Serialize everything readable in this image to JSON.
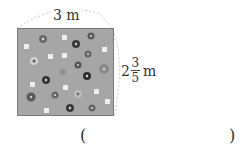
{
  "figure": {
    "width_label": "3 m",
    "height_label": {
      "whole": "2",
      "numerator": "3",
      "denominator": "5",
      "unit": "m"
    },
    "shape": "rectangle",
    "fill_color": "#a6a6a6",
    "content": "flower garden"
  },
  "answer": {
    "open_paren": "(",
    "close_paren": ")",
    "value": ""
  }
}
